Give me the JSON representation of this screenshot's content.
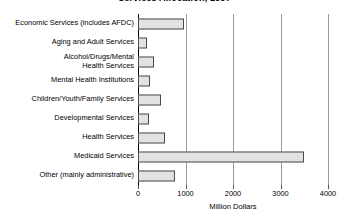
{
  "chart_data": {
    "type": "bar",
    "orientation": "horizontal",
    "title": "Services Allocation, 1997",
    "xlabel": "Million Dollars",
    "ylabel": "",
    "xlim": [
      0,
      4000
    ],
    "xticks": [
      0,
      1000,
      2000,
      3000,
      4000
    ],
    "xticklabels": [
      "0",
      "1000",
      "2000",
      "3000",
      "4000"
    ],
    "grid": "vertical",
    "legend": "none",
    "bar_fill_color": "#e2e2e2",
    "bar_edge_color": "#4a4a4a",
    "categories": [
      "Economic Services (includes AFDC)",
      "Aging and Adult Services",
      "Alcohol/Drugs/Mental\nHealth Services",
      "Mental Health Institutions",
      "Children/Youth/Family Services",
      "Developmental Services",
      "Health Services",
      "Medicaid Services",
      "Other (mainly administrative)"
    ],
    "values": [
      970,
      190,
      340,
      250,
      480,
      230,
      570,
      3500,
      780
    ]
  }
}
